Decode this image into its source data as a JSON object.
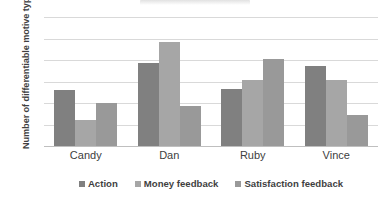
{
  "chart_data": {
    "type": "bar",
    "title": "",
    "xlabel": "",
    "ylabel": "Number of differentiable motive types",
    "categories": [
      "Candy",
      "Dan",
      "Ruby",
      "Vince"
    ],
    "series": [
      {
        "name": "Action",
        "values": [
          13,
          19.3,
          13.3,
          18.5
        ],
        "color": "#808080"
      },
      {
        "name": "Money feedback",
        "values": [
          6,
          24.2,
          15.3,
          15.4
        ],
        "color": "#a6a6a6"
      },
      {
        "name": "Satisfaction feedback",
        "values": [
          10,
          9.2,
          20.3,
          7.3
        ],
        "color": "#999999"
      }
    ],
    "ylim": [
      0,
      30
    ],
    "yticks": [
      0,
      5,
      10,
      15,
      20,
      25,
      30
    ],
    "ytick_labels": [
      "0",
      "5",
      "10",
      "15",
      "20",
      "25",
      "30"
    ],
    "grid": true,
    "legend_position": "bottom",
    "gridline_color": "#d9d9d9",
    "axis_color": "#bfbfbf",
    "background": "#ffffff"
  }
}
